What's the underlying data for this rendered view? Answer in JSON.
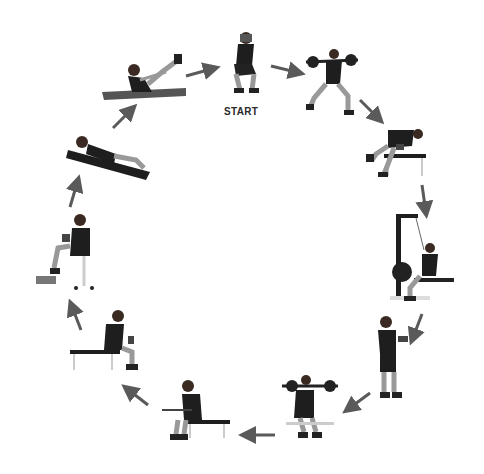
{
  "diagram": {
    "type": "circuit-workout-cycle",
    "direction": "clockwise",
    "start_label": "START",
    "arrow_color": "#5a5a5a",
    "figure_color": "#1e1e1e",
    "steps": [
      {
        "index": 1,
        "exercise": "squat (hands behind head)",
        "position": "top-center",
        "is_start": true
      },
      {
        "index": 2,
        "exercise": "barbell lunge",
        "position": "top-right"
      },
      {
        "index": 3,
        "exercise": "one-arm dumbbell row on bench",
        "position": "upper-right"
      },
      {
        "index": 4,
        "exercise": "seated cable row / lat machine",
        "position": "right"
      },
      {
        "index": 5,
        "exercise": "standing dumbbell hammer curl",
        "position": "lower-right"
      },
      {
        "index": 6,
        "exercise": "seated barbell shoulder press (front)",
        "position": "bottom-right"
      },
      {
        "index": 7,
        "exercise": "seated barbell wrist curl",
        "position": "bottom-center"
      },
      {
        "index": 8,
        "exercise": "seated dumbbell wrist curl on bench",
        "position": "lower-left"
      },
      {
        "index": 9,
        "exercise": "seated dumbbell calf raise",
        "position": "left"
      },
      {
        "index": 10,
        "exercise": "crunch on mat",
        "position": "upper-left"
      },
      {
        "index": 11,
        "exercise": "V-up on mat",
        "position": "top-left"
      }
    ],
    "arrows": [
      {
        "from": 11,
        "to": 1,
        "x1": 186,
        "y1": 76,
        "x2": 215,
        "y2": 68
      },
      {
        "from": 1,
        "to": 2,
        "x1": 271,
        "y1": 66,
        "x2": 300,
        "y2": 73
      },
      {
        "from": 2,
        "to": 3,
        "x1": 360,
        "y1": 100,
        "x2": 380,
        "y2": 120
      },
      {
        "from": 3,
        "to": 4,
        "x1": 422,
        "y1": 185,
        "x2": 426,
        "y2": 213
      },
      {
        "from": 4,
        "to": 5,
        "x1": 422,
        "y1": 314,
        "x2": 412,
        "y2": 340
      },
      {
        "from": 5,
        "to": 6,
        "x1": 370,
        "y1": 393,
        "x2": 347,
        "y2": 410
      },
      {
        "from": 6,
        "to": 7,
        "x1": 275,
        "y1": 435,
        "x2": 244,
        "y2": 435
      },
      {
        "from": 7,
        "to": 8,
        "x1": 148,
        "y1": 405,
        "x2": 126,
        "y2": 388
      },
      {
        "from": 8,
        "to": 9,
        "x1": 81,
        "y1": 330,
        "x2": 71,
        "y2": 304
      },
      {
        "from": 9,
        "to": 10,
        "x1": 70,
        "y1": 207,
        "x2": 78,
        "y2": 180
      },
      {
        "from": 10,
        "to": 11,
        "x1": 113,
        "y1": 128,
        "x2": 133,
        "y2": 108
      }
    ]
  }
}
